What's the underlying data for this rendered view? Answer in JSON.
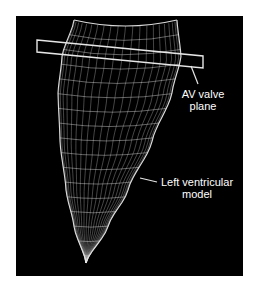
{
  "figure": {
    "background_color": "#000000",
    "line_color": "#e6e6e6",
    "labels": {
      "av_valve": {
        "line1": "AV valve",
        "line2": "plane"
      },
      "lv_model": {
        "line1": "Left ventricular",
        "line2": "model"
      }
    },
    "mesh": {
      "longitudinal_lines": 22,
      "circumferential_rings": 16
    }
  }
}
